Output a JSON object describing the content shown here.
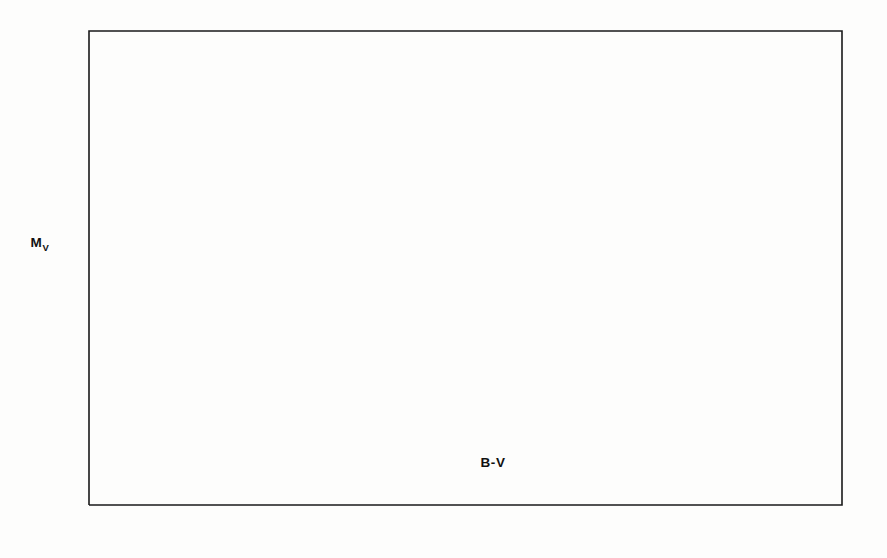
{
  "chart_data": {
    "type": "scatter",
    "title": "",
    "xlabel": "B-V",
    "ylabel": "Mv",
    "ylabel_main": "M",
    "ylabel_sub": "V",
    "xlim": [
      -0.5,
      1.55
    ],
    "ylim_top": -5.1,
    "ylim_bottom": 7.6,
    "y_inverted": true,
    "grid": false,
    "legend": null,
    "xticks": [
      -0.4,
      -0.2,
      0.0,
      0.2,
      0.4,
      0.6,
      0.8,
      1.0,
      1.2,
      1.4
    ],
    "xtick_labels": [
      "-0.4",
      "-0.2",
      "0.0",
      "+0.2",
      "+0.4",
      "+0.6",
      "+0.8",
      "+1.0",
      "+1.2",
      "+1.4"
    ],
    "yticks": [
      -4,
      -2,
      0,
      2,
      4,
      6
    ],
    "ytick_labels": [
      "-4",
      "-2",
      "0",
      "+2",
      "+4",
      "+6"
    ],
    "annotations": [
      {
        "id": "zams-label",
        "text": "ZERO AGE M.S.",
        "x": 0.23,
        "y": 5.27
      }
    ],
    "curves": [
      {
        "name": "zero-age-main-sequence",
        "style": "solid",
        "points": [
          [
            -0.305,
            -4.85
          ],
          [
            -0.295,
            -4.35
          ],
          [
            -0.282,
            -3.7
          ],
          [
            -0.268,
            -3.05
          ],
          [
            -0.252,
            -2.45
          ],
          [
            -0.234,
            -1.85
          ],
          [
            -0.213,
            -1.25
          ],
          [
            -0.19,
            -0.7
          ],
          [
            -0.165,
            -0.2
          ],
          [
            -0.138,
            0.28
          ],
          [
            -0.108,
            0.7
          ],
          [
            -0.075,
            1.05
          ],
          [
            -0.04,
            1.28
          ],
          [
            0.0,
            1.44
          ],
          [
            0.045,
            1.55
          ],
          [
            0.09,
            1.72
          ],
          [
            0.14,
            1.95
          ],
          [
            0.195,
            2.26
          ],
          [
            0.25,
            2.6
          ],
          [
            0.305,
            2.98
          ],
          [
            0.345,
            3.24
          ],
          [
            0.395,
            3.6
          ],
          [
            0.455,
            4.02
          ],
          [
            0.52,
            4.47
          ],
          [
            0.59,
            4.93
          ],
          [
            0.665,
            5.42
          ],
          [
            0.745,
            5.93
          ],
          [
            0.83,
            6.44
          ],
          [
            0.92,
            6.93
          ],
          [
            1.01,
            7.32
          ],
          [
            1.09,
            7.55
          ],
          [
            1.17,
            7.65
          ]
        ]
      },
      {
        "name": "giant-branch",
        "style": "solid",
        "points": [
          [
            0.955,
            4.5
          ],
          [
            1.0,
            4.02
          ],
          [
            1.045,
            3.5
          ],
          [
            1.085,
            2.95
          ],
          [
            1.125,
            2.35
          ],
          [
            1.17,
            1.72
          ],
          [
            1.215,
            1.15
          ],
          [
            1.265,
            0.68
          ],
          [
            1.32,
            0.32
          ],
          [
            1.385,
            0.05
          ],
          [
            1.45,
            -0.15
          ],
          [
            1.52,
            -0.32
          ],
          [
            1.55,
            -0.38
          ]
        ]
      }
    ],
    "points": [
      {
        "id": "lambda-179",
        "label": "λ 179",
        "x": 1.205,
        "y": -2.6,
        "label_dx": 13,
        "label_dy": 5
      },
      {
        "id": "ads-8035",
        "label": "ADS 8035",
        "x": 1.068,
        "y": 0.23,
        "label_dx": 13,
        "label_dy": -4
      },
      {
        "id": "ads-11468",
        "label": "ADS11468",
        "x": 1.075,
        "y": 0.02,
        "label_dx": 11,
        "label_dy": 16
      },
      {
        "id": "ads-16836",
        "label": "ADS 16836",
        "x": 1.27,
        "y": -0.09,
        "label_dx": 13,
        "label_dy": 4
      },
      {
        "id": "ads-16538",
        "label": "ADS 16538",
        "x": 0.73,
        "y": 1.02,
        "label_dx": 13,
        "label_dy": 4
      },
      {
        "id": "ads-11479",
        "label": "ADS 11479",
        "x": 1.06,
        "y": 1.82,
        "label_dx": 13,
        "label_dy": -5
      },
      {
        "id": "ads-755",
        "label": "ADS 755",
        "x": 1.012,
        "y": 4.1,
        "label_dx": 13,
        "label_dy": 4
      }
    ],
    "connectors": [
      {
        "id": "conn-lambda-179",
        "from": [
          -0.195,
          -2.33
        ],
        "to": [
          1.188,
          -2.6
        ]
      },
      {
        "id": "conn-ads-8035",
        "from": [
          0.042,
          1.55
        ],
        "to": [
          1.055,
          0.25
        ]
      },
      {
        "id": "conn-ads-11468",
        "from": [
          0.178,
          2.18
        ],
        "to": [
          1.062,
          0.05
        ]
      },
      {
        "id": "conn-ads-16538-a",
        "from": [
          0.31,
          3.02
        ],
        "to": [
          0.716,
          1.03
        ]
      },
      {
        "id": "conn-ads-16538-b",
        "from": [
          0.378,
          3.45
        ],
        "to": [
          0.716,
          1.06
        ]
      },
      {
        "id": "conn-ads-11479",
        "from": [
          0.845,
          6.58
        ],
        "to": [
          1.055,
          1.9
        ]
      },
      {
        "id": "conn-ads-755",
        "from": [
          1.195,
          7.62
        ],
        "to": [
          1.022,
          4.05
        ]
      }
    ],
    "leaders": [
      {
        "id": "zams-leader",
        "from": [
          0.398,
          5.22
        ],
        "to": [
          0.448,
          4.52
        ]
      }
    ]
  },
  "frame": {
    "left_px": 89,
    "right_px": 842,
    "top_px": 31,
    "bottom_px": 505
  }
}
